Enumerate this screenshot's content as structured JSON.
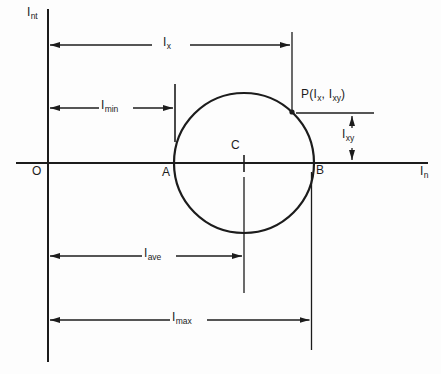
{
  "figure": {
    "background": "#fdfdfd",
    "ink": "#1c1c1c",
    "type": "mohr-circle-moment-of-inertia-diagram"
  },
  "axes": {
    "vertical_label": {
      "base": "I",
      "sub": "nt"
    },
    "horizontal_label": {
      "base": "I",
      "sub": "n"
    },
    "origin_label": "O"
  },
  "points": {
    "a_label": "A",
    "b_label": "B",
    "c_label": "C",
    "p_label": {
      "t1": "P(I",
      "sub1": "x",
      "t2": ", I",
      "sub2": "xy",
      "t3": ")"
    }
  },
  "dimensions": {
    "ix": {
      "base": "I",
      "sub": "x"
    },
    "imin": {
      "base": "I",
      "sub": "min"
    },
    "iave": {
      "base": "I",
      "sub": "ave"
    },
    "imax": {
      "base": "I",
      "sub": "max"
    },
    "ixy": {
      "base": "I",
      "sub": "xy"
    }
  }
}
